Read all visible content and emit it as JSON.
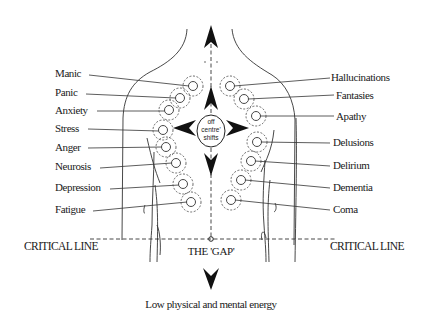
{
  "diagram": {
    "center_label_lines": [
      "off",
      "centre'",
      "shifts"
    ],
    "gap_label": "THE 'GAP'",
    "critical_line_left": "CRITICAL LINE",
    "critical_line_right": "CRITICAL LINE",
    "bottom_label": "Low physical and mental energy",
    "left_states": [
      {
        "label": "Manic"
      },
      {
        "label": "Panic"
      },
      {
        "label": "Anxiety"
      },
      {
        "label": "Stress"
      },
      {
        "label": "Anger"
      },
      {
        "label": "Neurosis"
      },
      {
        "label": "Depression"
      },
      {
        "label": "Fatigue"
      }
    ],
    "right_states": [
      {
        "label": "Hallucinations"
      },
      {
        "label": "Fantasies"
      },
      {
        "label": "Apathy"
      },
      {
        "label": "Delusions"
      },
      {
        "label": "Delirium"
      },
      {
        "label": "Dementia"
      },
      {
        "label": "Coma"
      }
    ],
    "arrows": [
      "up-arrow",
      "down-arrow",
      "left-arrow",
      "right-arrow",
      "bottom-down-arrow"
    ]
  }
}
